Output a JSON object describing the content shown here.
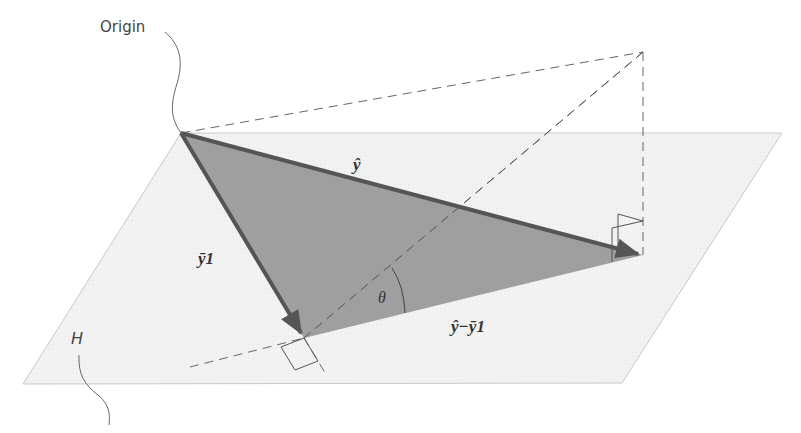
{
  "labels": {
    "origin": "Origin",
    "plane": "H",
    "yhat": "ŷ",
    "ybar_one": "ȳ1",
    "theta": "θ",
    "difference": "ŷ−ȳ1"
  },
  "colors": {
    "background": "#ffffff",
    "plane_fill": "#f2f2f2",
    "plane_edge": "#c8c8c8",
    "triangle_fill": "#9a9a9a",
    "vector": "#555555",
    "dashed": "#666666",
    "annotation_line": "#666666"
  },
  "geometry": {
    "plane": [
      [
        181,
        133
      ],
      [
        782,
        133
      ],
      [
        622,
        383
      ],
      [
        23,
        384
      ]
    ],
    "origin": [
      181,
      133
    ],
    "yhat_tip": [
      643,
      255
    ],
    "ybar_tip": [
      304,
      338
    ],
    "apex": [
      643,
      52
    ]
  }
}
